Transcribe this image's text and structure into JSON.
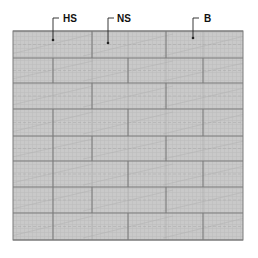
{
  "diagram": {
    "type": "brick-wall-pattern",
    "colors": {
      "background": "#ffffff",
      "fill": "#c9c9c9",
      "texture": "#bdbdbd",
      "joint": "#7a7a7a",
      "faint_joint": "#a9a9a9",
      "diagonal": "#b3b3b3",
      "leader": "#222222",
      "label": "#111111"
    },
    "wall": {
      "x": 13,
      "y": 31,
      "width": 230,
      "height": 209
    },
    "course_lines_y": [
      31,
      58,
      83,
      109,
      136,
      161,
      187,
      213,
      240
    ],
    "courses": [
      {
        "index": 0,
        "strong_joints_x": [
          92,
          166
        ],
        "faint_joints_x": [
          53,
          128,
          203
        ]
      },
      {
        "index": 1,
        "strong_joints_x": [
          53,
          128,
          203
        ],
        "faint_joints_x": [
          92,
          166
        ]
      },
      {
        "index": 2,
        "strong_joints_x": [
          92,
          166
        ],
        "faint_joints_x": [
          53,
          128,
          203
        ]
      },
      {
        "index": 3,
        "strong_joints_x": [
          53,
          128,
          203
        ],
        "faint_joints_x": [
          92,
          166
        ]
      },
      {
        "index": 4,
        "strong_joints_x": [
          53,
          92,
          166
        ],
        "faint_joints_x": [
          128,
          203
        ]
      },
      {
        "index": 5,
        "strong_joints_x": [
          53,
          128,
          203
        ],
        "faint_joints_x": [
          92,
          166
        ]
      },
      {
        "index": 6,
        "strong_joints_x": [
          53,
          92,
          166
        ],
        "faint_joints_x": [
          128,
          203
        ]
      },
      {
        "index": 7,
        "strong_joints_x": [
          53,
          128,
          203
        ],
        "faint_joints_x": [
          92,
          166
        ]
      }
    ],
    "labels": [
      {
        "id": "hs",
        "text": "HS",
        "text_x": 63,
        "text_y": 22,
        "leader_x": 53,
        "leader_top": 18,
        "tick_end_x": 59,
        "dot_y": 40
      },
      {
        "id": "ns",
        "text": "NS",
        "text_x": 117,
        "text_y": 22,
        "leader_x": 108,
        "leader_top": 18,
        "tick_end_x": 114,
        "dot_y": 43
      },
      {
        "id": "b",
        "text": "B",
        "text_x": 204,
        "text_y": 22,
        "leader_x": 193,
        "leader_top": 18,
        "tick_end_x": 199,
        "dot_y": 38
      }
    ]
  }
}
